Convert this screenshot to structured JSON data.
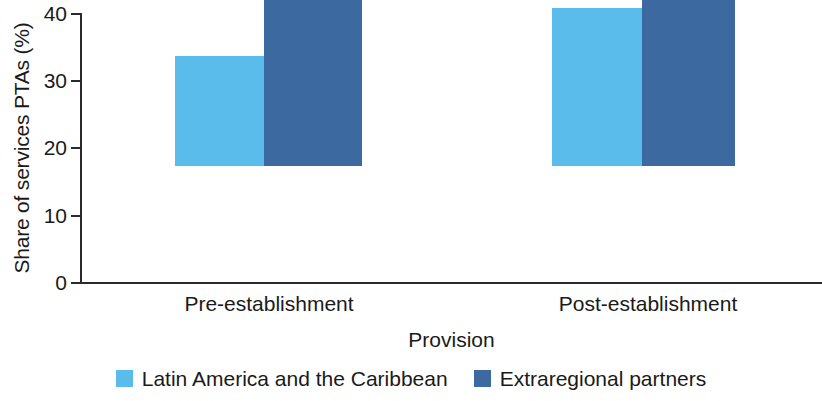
{
  "chart_data": {
    "type": "bar",
    "title": "",
    "xlabel": "Provision",
    "ylabel": "Share of services PTAs (%)",
    "categories": [
      "Pre-establishment",
      "Post-establishment"
    ],
    "series": [
      {
        "name": "Latin America and the Caribbean",
        "color": "#59BCEA",
        "values": [
          16.4,
          23.5
        ]
      },
      {
        "name": "Extraregional partners",
        "color": "#3C69A0",
        "values": [
          34.3,
          34.3
        ]
      }
    ],
    "ylim": [
      0,
      40
    ],
    "yticks": [
      0,
      10,
      20,
      30,
      40
    ],
    "ytick_labels": [
      "0",
      "10",
      "20",
      "30",
      "40"
    ],
    "grid": false,
    "legend_position": "bottom"
  },
  "axes": {
    "y_title": "Share of services PTAs (%)",
    "x_title": "Provision",
    "y_ticks": [
      {
        "label": "40",
        "value": 40
      },
      {
        "label": "30",
        "value": 30
      },
      {
        "label": "20",
        "value": 20
      },
      {
        "label": "10",
        "value": 10
      },
      {
        "label": "0",
        "value": 0
      }
    ]
  },
  "groups": [
    {
      "label": "Pre-establishment",
      "bars": [
        {
          "series": "Latin America and the Caribbean",
          "value": 16.4,
          "color": "#59BCEA"
        },
        {
          "series": "Extraregional partners",
          "value": 34.3,
          "color": "#3C69A0"
        }
      ]
    },
    {
      "label": "Post-establishment",
      "bars": [
        {
          "series": "Latin America and the Caribbean",
          "value": 23.5,
          "color": "#59BCEA"
        },
        {
          "series": "Extraregional partners",
          "value": 34.3,
          "color": "#3C69A0"
        }
      ]
    }
  ],
  "legend": {
    "items": [
      {
        "label": "Latin America and the Caribbean",
        "color": "#59BCEA"
      },
      {
        "label": "Extraregional partners",
        "color": "#3C69A0"
      }
    ]
  }
}
